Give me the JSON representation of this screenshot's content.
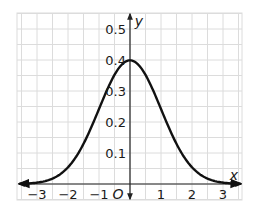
{
  "chart_data": {
    "type": "line",
    "title": "",
    "xlabel": "x",
    "ylabel": "y",
    "origin_label": "O",
    "xlim": [
      -3.5,
      3.5
    ],
    "ylim": [
      0,
      0.55
    ],
    "grid": true,
    "x_ticks": [
      -3,
      -2,
      -1,
      1,
      2,
      3
    ],
    "x_tick_labels": [
      "−3",
      "−2",
      "−1",
      "1",
      "2",
      "3"
    ],
    "y_ticks": [
      0.1,
      0.2,
      0.3,
      0.4,
      0.5
    ],
    "y_tick_labels": [
      "0.1",
      "0.2",
      "0.3",
      "0.4",
      "0.5"
    ],
    "series": [
      {
        "name": "standard normal curve",
        "function": "y = (1/sqrt(2*pi)) * exp(-x^2/2)",
        "x": [
          -3.5,
          -3,
          -2.5,
          -2,
          -1.5,
          -1,
          -0.5,
          0,
          0.5,
          1,
          1.5,
          2,
          2.5,
          3,
          3.5
        ],
        "values": [
          0.001,
          0.004,
          0.018,
          0.054,
          0.13,
          0.242,
          0.352,
          0.399,
          0.352,
          0.242,
          0.13,
          0.054,
          0.018,
          0.004,
          0.001
        ],
        "color": "#111111",
        "arrows_both_ends": true
      }
    ],
    "colors": {
      "grid": "#dcdcdc",
      "axis": "#222222",
      "curve": "#111111"
    }
  }
}
